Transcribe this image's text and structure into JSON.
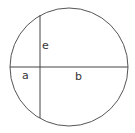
{
  "diagram": {
    "type": "geometry",
    "circle": {
      "cx": 69,
      "cy": 67,
      "r": 59,
      "stroke": "#555555"
    },
    "diameter": {
      "x1": 10,
      "y1": 67,
      "x2": 128,
      "y2": 67
    },
    "chord": {
      "x1": 40,
      "y1": 15,
      "x2": 40,
      "y2": 118
    },
    "labels": {
      "e": "e",
      "a": "a",
      "b": "b"
    },
    "line_color": "#444444"
  }
}
